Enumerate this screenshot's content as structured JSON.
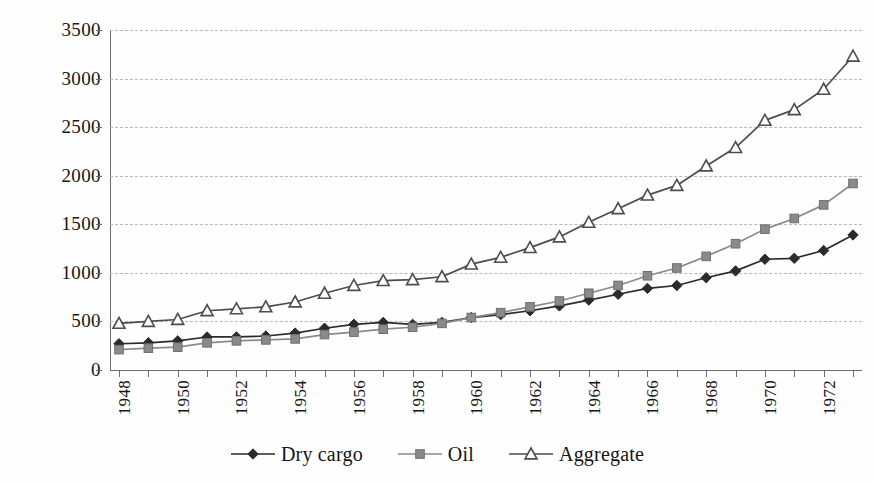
{
  "chart_data": {
    "type": "line",
    "title": "",
    "subtitle": "",
    "xlabel": "",
    "ylabel": "",
    "xlim": [
      1948,
      1973
    ],
    "ylim": [
      0,
      3500
    ],
    "ytick_step": 500,
    "grid": true,
    "grid_style": "dashed-horizontal",
    "legend_position": "bottom-center",
    "x": [
      1948,
      1949,
      1950,
      1951,
      1952,
      1953,
      1954,
      1955,
      1956,
      1957,
      1958,
      1959,
      1960,
      1961,
      1962,
      1963,
      1964,
      1965,
      1966,
      1967,
      1968,
      1969,
      1970,
      1971,
      1972,
      1973
    ],
    "xtick_labels": [
      "1948",
      "",
      "1950",
      "",
      "1952",
      "",
      "1954",
      "",
      "1956",
      "",
      "1958",
      "",
      "1960",
      "",
      "1962",
      "",
      "1964",
      "",
      "1966",
      "",
      "1968",
      "",
      "1970",
      "",
      "1972",
      ""
    ],
    "ytick_labels": [
      "0",
      "500",
      "1000",
      "1500",
      "2000",
      "2500",
      "3000",
      "3500"
    ],
    "ytick_values": [
      0,
      500,
      1000,
      1500,
      2000,
      2500,
      3000,
      3500
    ],
    "series": [
      {
        "name": "Dry cargo",
        "marker": "diamond",
        "color": "#2b2b2b",
        "values": [
          270,
          280,
          300,
          340,
          340,
          350,
          380,
          430,
          470,
          490,
          470,
          490,
          540,
          570,
          610,
          660,
          720,
          780,
          840,
          870,
          950,
          1020,
          1140,
          1150,
          1230,
          1390
        ]
      },
      {
        "name": "Oil",
        "marker": "square",
        "color": "#8a8a8a",
        "values": [
          210,
          225,
          235,
          280,
          300,
          310,
          320,
          365,
          390,
          420,
          440,
          480,
          540,
          590,
          650,
          710,
          790,
          870,
          970,
          1050,
          1170,
          1300,
          1450,
          1560,
          1700,
          1920
        ]
      },
      {
        "name": "Aggregate",
        "marker": "triangle",
        "color": "#4d4d4d",
        "values": [
          480,
          500,
          520,
          610,
          630,
          650,
          700,
          790,
          870,
          920,
          930,
          960,
          1090,
          1160,
          1260,
          1370,
          1520,
          1660,
          1800,
          1900,
          2100,
          2290,
          2570,
          2680,
          2890,
          3230
        ]
      }
    ]
  },
  "legend": {
    "items": [
      {
        "label": "Dry cargo",
        "marker": "diamond",
        "color": "#2b2b2b"
      },
      {
        "label": "Oil",
        "marker": "square",
        "color": "#8a8a8a"
      },
      {
        "label": "Aggregate",
        "marker": "triangle",
        "color": "#4d4d4d"
      }
    ]
  }
}
